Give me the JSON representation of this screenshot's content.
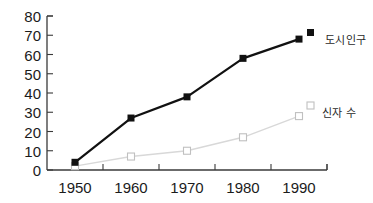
{
  "chart_data": {
    "type": "line",
    "title": "",
    "xlabel": "",
    "ylabel": "",
    "categories": [
      "1950",
      "1960",
      "1970",
      "1980",
      "1990"
    ],
    "x": [
      1950,
      1960,
      1970,
      1980,
      1990
    ],
    "xlim": [
      1945,
      1995
    ],
    "ylim": [
      0,
      80
    ],
    "yticks": [
      0,
      10,
      20,
      30,
      40,
      50,
      60,
      70,
      80
    ],
    "xticks": [
      "1950",
      "1960",
      "1970",
      "1980",
      "1990"
    ],
    "grid": false,
    "legend_position": "right-inline",
    "series": [
      {
        "name": "도시인구",
        "values": [
          4,
          27,
          38,
          58,
          68
        ],
        "color": "#111111",
        "marker": "filled-square",
        "line_width": 2.2
      },
      {
        "name": "신자 수",
        "values": [
          2,
          7,
          10,
          17,
          28
        ],
        "color": "#d8d8d8",
        "marker": "open-square",
        "line_width": 1.4
      }
    ]
  },
  "axis": {
    "y_tick_labels": [
      "80",
      "70",
      "60",
      "50",
      "40",
      "30",
      "20",
      "10",
      "0"
    ],
    "x_tick_labels": [
      "1950",
      "1960",
      "1970",
      "1980",
      "1990"
    ],
    "axis_color": "#3a3a3a"
  },
  "legend": {
    "urban": {
      "label": "도시인구",
      "marker": "filled-square",
      "color": "#111111"
    },
    "believers": {
      "label": "신자 수",
      "marker": "open-square",
      "color": "#c9c9c9"
    }
  }
}
